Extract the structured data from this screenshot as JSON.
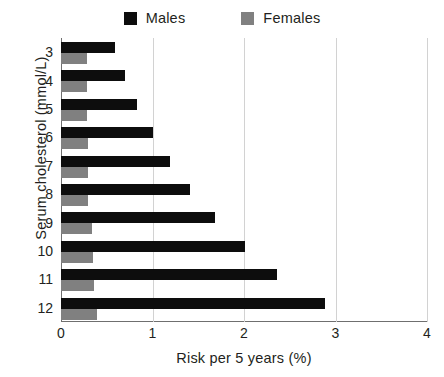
{
  "legend": {
    "position": "top-center",
    "entries": [
      {
        "label": "Males",
        "color": "#0d0d0d",
        "swatch": "square-marker-icon"
      },
      {
        "label": "Females",
        "color": "#808080",
        "swatch": "square-marker-icon"
      }
    ]
  },
  "chart_data": {
    "type": "bar",
    "orientation": "horizontal",
    "title": "",
    "xlabel": "Risk per 5 years (%)",
    "ylabel": "Serum cholesterol (mmol/L)",
    "categories": [
      "3",
      "4",
      "5",
      "6",
      "7",
      "8",
      "9",
      "10",
      "11",
      "12"
    ],
    "series": [
      {
        "name": "Males",
        "color": "#0d0d0d",
        "values": [
          0.59,
          0.7,
          0.83,
          1.0,
          1.19,
          1.41,
          1.68,
          2.01,
          2.36,
          2.88
        ]
      },
      {
        "name": "Females",
        "color": "#808080",
        "values": [
          0.28,
          0.28,
          0.28,
          0.3,
          0.3,
          0.3,
          0.34,
          0.35,
          0.36,
          0.39
        ]
      }
    ],
    "xlim": [
      0,
      4
    ],
    "xticks": [
      "0",
      "1",
      "2",
      "3",
      "4"
    ],
    "xtick_values": [
      0,
      1,
      2,
      3,
      4
    ],
    "grid": "vertical",
    "legend_position": "top-center"
  }
}
